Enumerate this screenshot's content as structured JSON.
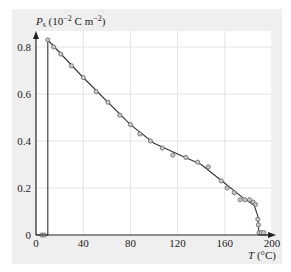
{
  "chart_data": {
    "type": "line",
    "title": "",
    "ylabel": "P_s (10^-2 C m^-2)",
    "xlabel": "T (°C)",
    "xlim": [
      0,
      200
    ],
    "ylim": [
      0,
      0.85
    ],
    "xticks": [
      0,
      40,
      80,
      120,
      160,
      200
    ],
    "yticks": [
      0,
      0.2,
      0.4,
      0.6,
      0.8
    ],
    "xtick_labels": [
      "0",
      "40",
      "80",
      "120",
      "160",
      "200"
    ],
    "ytick_labels": [
      "0",
      "0.2",
      "0.4",
      "0.6",
      "0.8"
    ],
    "grid": true,
    "legend": null,
    "series": [
      {
        "name": "measured",
        "style": "markers (open circles)",
        "x": [
          5,
          7,
          10,
          15,
          21,
          30,
          40,
          51,
          61,
          71,
          80,
          88,
          97,
          107,
          116,
          127,
          137,
          146,
          157,
          162,
          168,
          173,
          177,
          181,
          184,
          186,
          188,
          188.5,
          189,
          191,
          193
        ],
        "y": [
          0.0,
          0.0,
          0.83,
          0.8,
          0.77,
          0.72,
          0.67,
          0.61,
          0.565,
          0.51,
          0.47,
          0.43,
          0.4,
          0.37,
          0.34,
          0.33,
          0.31,
          0.29,
          0.23,
          0.2,
          0.18,
          0.15,
          0.15,
          0.15,
          0.14,
          0.13,
          0.067,
          0.043,
          0.01,
          0.01,
          0.01
        ]
      },
      {
        "name": "fit",
        "style": "solid line",
        "x": [
          0,
          10,
          10,
          40,
          80,
          100,
          120,
          140,
          160,
          175,
          185,
          188,
          189,
          200
        ],
        "y": [
          0,
          0,
          0.83,
          0.67,
          0.47,
          0.39,
          0.345,
          0.3,
          0.22,
          0.16,
          0.125,
          0.08,
          0,
          0
        ]
      }
    ]
  },
  "labels": {
    "ylabel_main": "P",
    "ylabel_sub": "s",
    "ylabel_unit_open": " (10",
    "ylabel_exp1": "−2",
    "ylabel_unit_mid": " C m",
    "ylabel_exp2": "−2",
    "ylabel_unit_close": ")",
    "xlabel_main": "T",
    "xlabel_unit": " (°C)",
    "xticks": [
      "0",
      "40",
      "80",
      "120",
      "160",
      "200"
    ],
    "yticks": [
      "0",
      "0.2",
      "0.4",
      "0.6",
      "0.8"
    ]
  }
}
